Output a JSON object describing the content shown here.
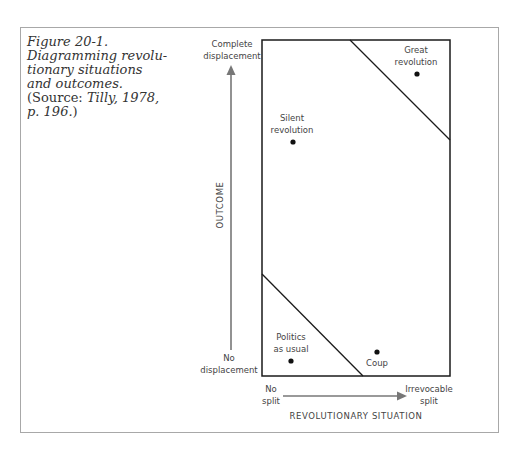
{
  "caption": {
    "figure": "Figure 20-1.",
    "title_lines": [
      "Diagramming revolu-",
      "tionary situations",
      "and outcomes."
    ],
    "source_prefix": "(Source: ",
    "source_ref": "Tilly, 1978,",
    "source_page": "p. 196.",
    "source_suffix": ")"
  },
  "y_axis": {
    "title": "OUTCOME",
    "top_label": [
      "Complete",
      "displacement"
    ],
    "bottom_label": [
      "No",
      "displacement"
    ]
  },
  "x_axis": {
    "title": "REVOLUTIONARY SITUATION",
    "left_label": [
      "No",
      "split"
    ],
    "right_label": [
      "Irrevocable",
      "split"
    ]
  },
  "regions": [
    {
      "name": "Great revolution",
      "lines": [
        "Great",
        "revolution"
      ]
    },
    {
      "name": "Silent revolution",
      "lines": [
        "Silent",
        "revolution"
      ]
    },
    {
      "name": "Politics as usual",
      "lines": [
        "Politics",
        "as usual"
      ]
    },
    {
      "name": "Coup",
      "lines": [
        "Coup"
      ]
    }
  ],
  "colors": {
    "box": "#1a1a1a",
    "arrow": "#777777",
    "frame": "#a8a8a8"
  }
}
